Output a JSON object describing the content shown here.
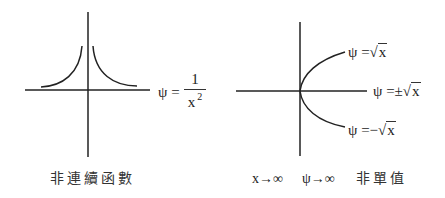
{
  "left_panel": {
    "formula": {
      "lhs": "ψ =",
      "numerator": "1",
      "denominator": "x",
      "exponent": "2"
    },
    "caption": "非連續函數",
    "curve": "psi = 1/x^2"
  },
  "right_panel": {
    "labels": {
      "upper": {
        "lhs": "ψ =",
        "sign": "",
        "radicand": "x",
        "root": "√"
      },
      "middle": {
        "lhs": "ψ =",
        "sign": "±",
        "radicand": "x",
        "root": "√"
      },
      "lower": {
        "lhs": "ψ =",
        "sign": "−",
        "radicand": "x",
        "root": "√"
      }
    },
    "asymptote_x": "x→∞",
    "asymptote_psi": "ψ→∞",
    "caption": "非單值",
    "curve": "psi = ±sqrt(x)"
  },
  "colors": {
    "stroke": "#222222",
    "background": "#ffffff"
  }
}
